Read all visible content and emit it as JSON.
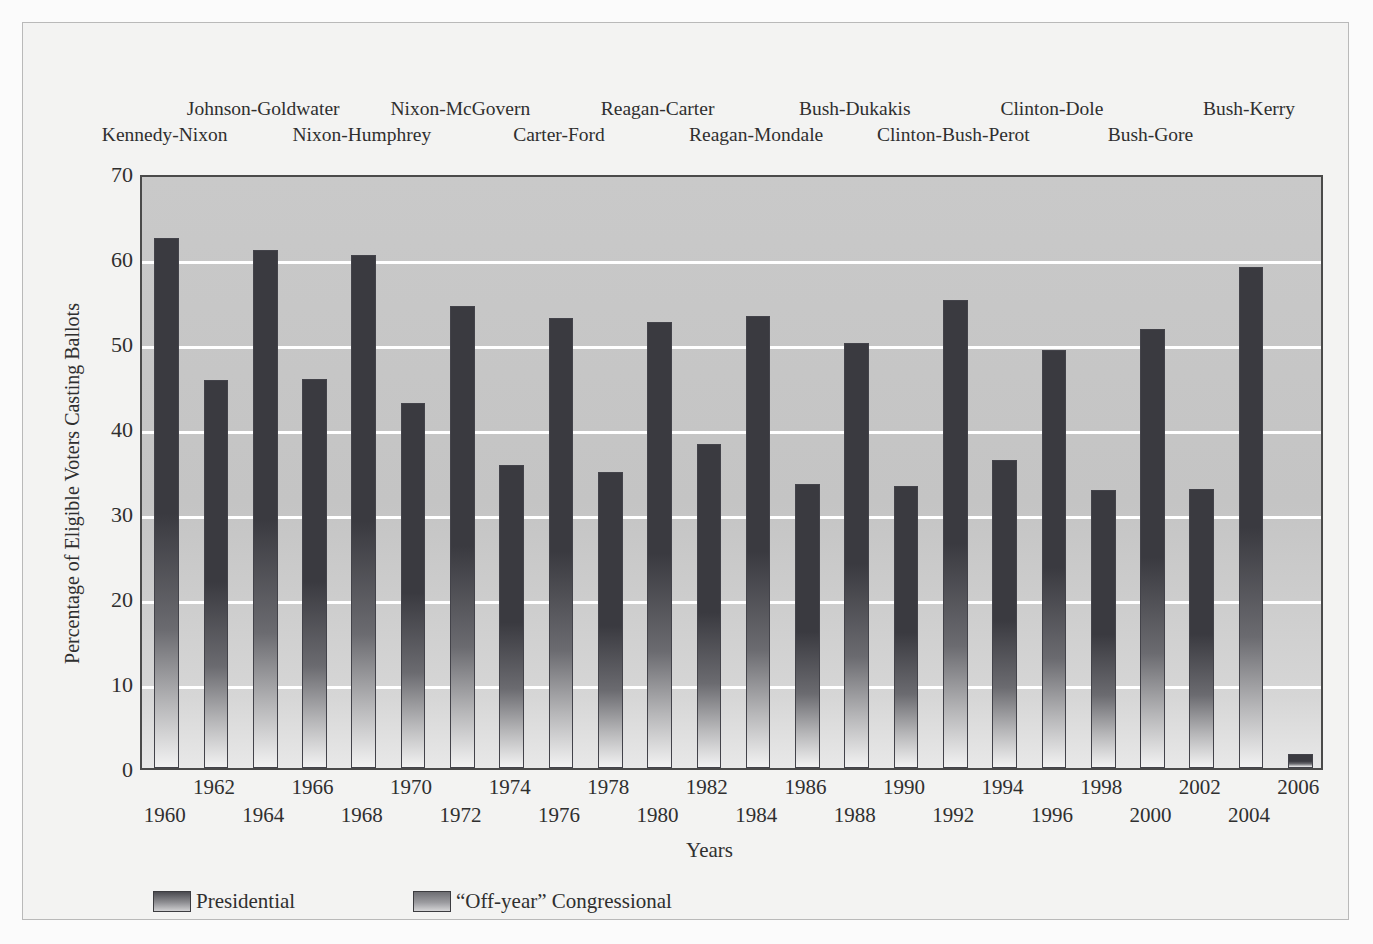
{
  "chart_data": {
    "type": "bar",
    "title": "",
    "xlabel": "Years",
    "ylabel": "Percentage of Eligible Voters Casting Ballots",
    "ylim": [
      0,
      70
    ],
    "yticks": [
      0,
      10,
      20,
      30,
      40,
      50,
      60,
      70
    ],
    "grid": true,
    "legend_position": "bottom-left",
    "categories": [
      "1960",
      "1962",
      "1964",
      "1966",
      "1968",
      "1970",
      "1972",
      "1974",
      "1976",
      "1978",
      "1980",
      "1982",
      "1984",
      "1986",
      "1988",
      "1990",
      "1992",
      "1994",
      "1996",
      "1998",
      "2000",
      "2002",
      "2004",
      "2006"
    ],
    "values": [
      62.4,
      45.6,
      61.0,
      45.8,
      60.3,
      43.0,
      54.3,
      35.7,
      52.9,
      34.8,
      52.5,
      38.1,
      53.2,
      33.4,
      50.0,
      33.2,
      55.1,
      36.2,
      49.2,
      32.7,
      51.7,
      32.8,
      58.9,
      1.7
    ],
    "series_by_category": [
      "Presidential",
      "Off-year Congressional",
      "Presidential",
      "Off-year Congressional",
      "Presidential",
      "Off-year Congressional",
      "Presidential",
      "Off-year Congressional",
      "Presidential",
      "Off-year Congressional",
      "Presidential",
      "Off-year Congressional",
      "Presidential",
      "Off-year Congressional",
      "Presidential",
      "Off-year Congressional",
      "Presidential",
      "Off-year Congressional",
      "Presidential",
      "Off-year Congressional",
      "Presidential",
      "Off-year Congressional",
      "Presidential",
      "Off-year Congressional"
    ],
    "annotations": [
      {
        "text": "Kennedy-Nixon",
        "category": "1960",
        "row": "bottom"
      },
      {
        "text": "Johnson-Goldwater",
        "category": "1964",
        "row": "top"
      },
      {
        "text": "Nixon-Humphrey",
        "category": "1968",
        "row": "bottom"
      },
      {
        "text": "Nixon-McGovern",
        "category": "1972",
        "row": "top"
      },
      {
        "text": "Carter-Ford",
        "category": "1976",
        "row": "bottom"
      },
      {
        "text": "Reagan-Carter",
        "category": "1980",
        "row": "top"
      },
      {
        "text": "Reagan-Mondale",
        "category": "1984",
        "row": "bottom"
      },
      {
        "text": "Bush-Dukakis",
        "category": "1988",
        "row": "top"
      },
      {
        "text": "Clinton-Bush-Perot",
        "category": "1992",
        "row": "bottom"
      },
      {
        "text": "Clinton-Dole",
        "category": "1996",
        "row": "top"
      },
      {
        "text": "Bush-Gore",
        "category": "2000",
        "row": "bottom"
      },
      {
        "text": "Bush-Kerry",
        "category": "2004",
        "row": "top"
      }
    ]
  },
  "axes": {
    "y_label": "Percentage of Eligible Voters Casting Ballots",
    "x_label": "Years",
    "y_tick_labels": [
      "70",
      "60",
      "50",
      "40",
      "30",
      "20",
      "10",
      "0"
    ],
    "x_tick_labels_top": [
      "1962",
      "1966",
      "1970",
      "1974",
      "1978",
      "1982",
      "1986",
      "1990",
      "1994",
      "1998",
      "2002",
      "2006"
    ],
    "x_tick_labels_bottom": [
      "1960",
      "1964",
      "1968",
      "1972",
      "1976",
      "1980",
      "1984",
      "1988",
      "1992",
      "1996",
      "2000",
      "2004"
    ]
  },
  "election_labels": {
    "top_row": [
      "Johnson-Goldwater",
      "Nixon-McGovern",
      "Reagan-Carter",
      "Bush-Dukakis",
      "Clinton-Dole",
      "Bush-Kerry"
    ],
    "bottom_row": [
      "Kennedy-Nixon",
      "Nixon-Humphrey",
      "Carter-Ford",
      "Reagan-Mondale",
      "Clinton-Bush-Perot",
      "Bush-Gore"
    ]
  },
  "legend": {
    "items": [
      {
        "label": "Presidential",
        "swatch": "presidential-swatch"
      },
      {
        "label": "“Off-year” Congressional",
        "swatch": "offyear-swatch"
      }
    ]
  },
  "colors": {
    "plot_background": "#c6c6c6",
    "page_background": "#f3f3f2",
    "gridline": "#ffffff",
    "bar_top": "#3a3a40",
    "bar_bottom": "#f2f2f2",
    "axis_border": "#4a4a4a",
    "text": "#2f2f2f"
  }
}
